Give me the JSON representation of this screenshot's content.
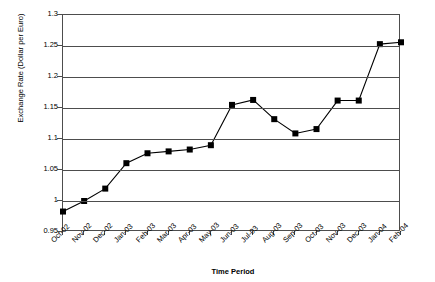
{
  "chart_data": {
    "type": "line",
    "title": "",
    "xlabel": "Time Period",
    "ylabel": "Exchange Rate (Dollar per Euro)",
    "categories": [
      "Oct-02",
      "Nov-02",
      "Dec-02",
      "Jan-03",
      "Feb-03",
      "Mar-03",
      "Apr-03",
      "May-03",
      "Jun-03",
      "Jul-03",
      "Aug-03",
      "Sep-03",
      "Oct-03",
      "Nov-03",
      "Dec-03",
      "Jan-04",
      "Feb-04"
    ],
    "values": [
      0.983,
      1.0,
      1.02,
      1.061,
      1.077,
      1.08,
      1.083,
      1.09,
      1.155,
      1.163,
      1.132,
      1.109,
      1.116,
      1.162,
      1.162,
      1.253,
      1.256
    ],
    "ylim": [
      0.95,
      1.3
    ],
    "ytick_labels": [
      "1.3",
      "1.25",
      "1.2",
      "1.15",
      "1.1",
      "1.05",
      "1",
      "0.95"
    ],
    "ytick_values": [
      1.3,
      1.25,
      1.2,
      1.15,
      1.1,
      1.05,
      1.0,
      0.95
    ],
    "grid": true,
    "legend": "none",
    "marker": "filled-square",
    "series_color": "#000000",
    "grid_color": "#4d4d4d"
  }
}
